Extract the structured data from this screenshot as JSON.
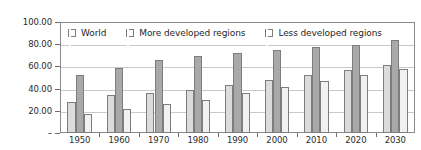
{
  "chart_data": {
    "type": "bar",
    "title": "",
    "xlabel": "",
    "ylabel": "",
    "categories": [
      "1950",
      "1960",
      "1970",
      "1980",
      "1990",
      "2000",
      "2010",
      "2020",
      "2030"
    ],
    "series": [
      {
        "name": "World",
        "color": "#dcdcdc",
        "values": [
          28.0,
          34.0,
          36.0,
          39.0,
          43.5,
          47.5,
          52.5,
          57.0,
          61.0
        ]
      },
      {
        "name": "More developed regions",
        "color": "#a9a9a9",
        "values": [
          52.5,
          59.0,
          66.0,
          69.5,
          72.0,
          75.0,
          77.5,
          79.5,
          84.0
        ]
      },
      {
        "name": "Less developed regions",
        "color": "#f1f1f1",
        "values": [
          17.5,
          21.5,
          26.0,
          30.0,
          36.0,
          41.5,
          47.0,
          52.5,
          58.0
        ]
      }
    ],
    "ylim": [
      0,
      100
    ],
    "y_ticks": [
      0,
      20,
      40,
      60,
      80,
      100
    ],
    "y_tick_labels": [
      "–",
      "20.00",
      "40.00",
      "60.00",
      "80.00",
      "100.00"
    ],
    "grid": true,
    "legend_position": "top-inside"
  }
}
